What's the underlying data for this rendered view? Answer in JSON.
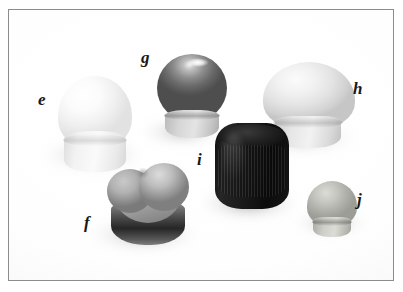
{
  "figure": {
    "caption": "",
    "background_color": "#ffffff",
    "frame_color": "#8a8c8e",
    "label_color": "#18181a",
    "label_style": "italic-serif",
    "width": 403,
    "height": 292
  },
  "objects": [
    {
      "label": "e",
      "name": "white-dome-cap",
      "description": "tall ivory/white dome-topped closure cap",
      "color": "#f4f4f4",
      "shape": "dome"
    },
    {
      "label": "f",
      "name": "heart-shaped-cap",
      "description": "heart-shaped cap, mid-grey top with dark band below",
      "color": "#9a9a9a",
      "shape": "heart"
    },
    {
      "label": "g",
      "name": "grey-sphere-cap",
      "description": "dark grey spherical cap with bright highlight on top",
      "color": "#6d6d6d",
      "shape": "sphere"
    },
    {
      "label": "h",
      "name": "pale-oval-cap",
      "description": "large pale oval dome cap",
      "color": "#e6e6e6",
      "shape": "oval-dome"
    },
    {
      "label": "i",
      "name": "black-ribbed-cap",
      "description": "black ribbed cylindrical cap with vertical ridges",
      "color": "#151515",
      "shape": "ribbed-cylinder"
    },
    {
      "label": "j",
      "name": "small-grey-cap",
      "description": "small grey-tan rounded cap",
      "color": "#b8b8b2",
      "shape": "rounded"
    }
  ]
}
